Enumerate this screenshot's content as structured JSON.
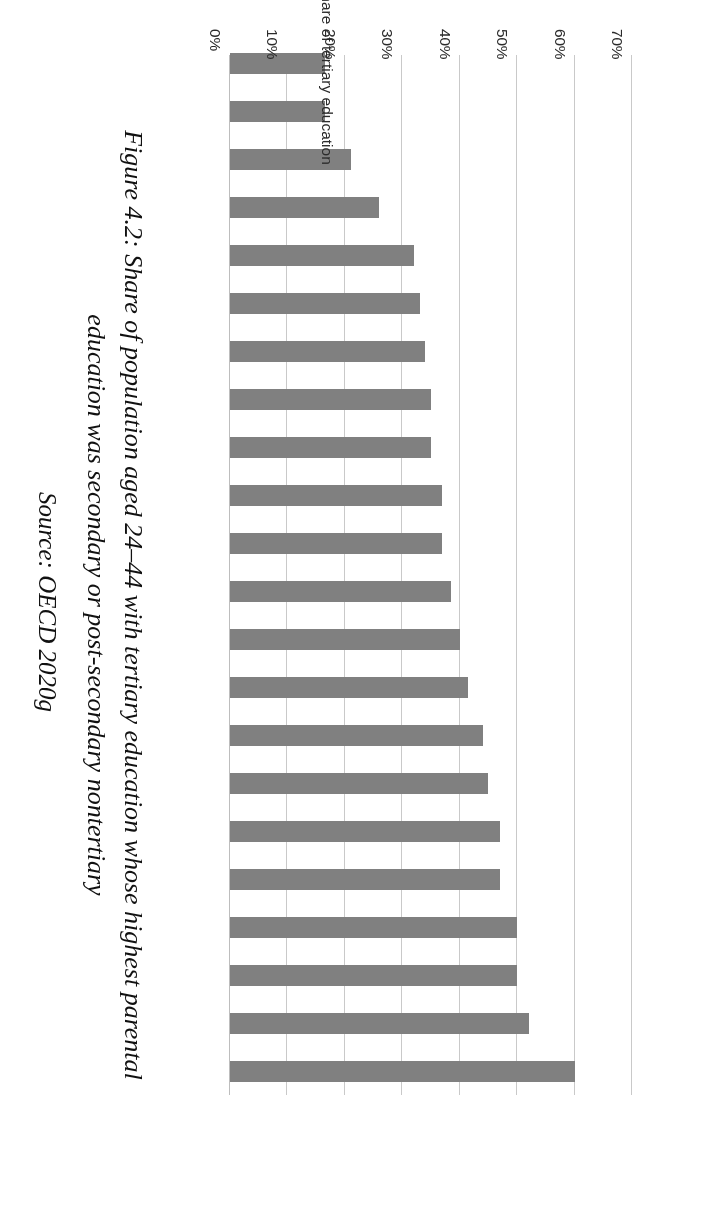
{
  "figure": {
    "caption": "Figure 4.2: Share of population aged 24–44 with tertiary education whose highest parental education was secondary or post-secondary nontertiary",
    "source": "Source: OECD 2020g"
  },
  "chart_data": {
    "type": "bar",
    "orientation": "horizontal",
    "title": "",
    "xlabel": "",
    "ylabel": "Share of tertiary education",
    "ylim": [
      0,
      70
    ],
    "grid": true,
    "legend": "none",
    "tick_labels": [
      "0%",
      "10%",
      "20%",
      "30%",
      "40%",
      "50%",
      "60%",
      "70%"
    ],
    "tick_values": [
      0,
      10,
      20,
      30,
      40,
      50,
      60,
      70
    ],
    "bar_color": "#808080",
    "gridline_color": "#c9c9c9",
    "categories": [
      "South Korea",
      "Canada",
      "New Zealand",
      "Israel",
      "Spain",
      "Finland",
      "Ireland",
      "UK",
      "France",
      "Estonia",
      "Norway",
      "Denmark",
      "Australia",
      "USA",
      "Poland",
      "Slovenia",
      "Sweden",
      "Italy",
      "Germany",
      "Slovak Republic",
      "Czech Republic",
      "Austria"
    ],
    "values": [
      60,
      52,
      50,
      50,
      47,
      47,
      45,
      44,
      41.5,
      40,
      38.5,
      37,
      37,
      35,
      35,
      34,
      33,
      32,
      26,
      21,
      16.5,
      16.5
    ]
  }
}
